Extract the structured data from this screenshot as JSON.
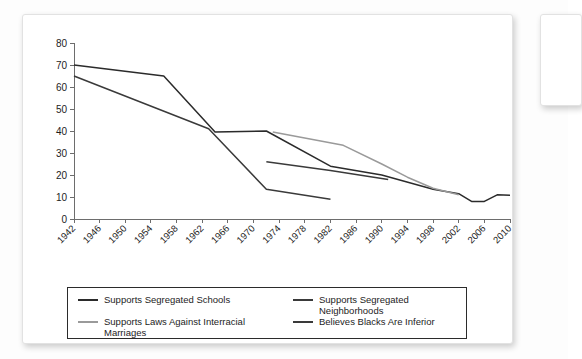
{
  "chart_data": {
    "type": "line",
    "title": "",
    "xlabel": "",
    "ylabel": "",
    "ylim": [
      0,
      80
    ],
    "yticks": [
      0,
      10,
      20,
      30,
      40,
      50,
      60,
      70,
      80
    ],
    "xticks": [
      "1942",
      "1946",
      "1950",
      "1954",
      "1958",
      "1962",
      "1966",
      "1970",
      "1974",
      "1978",
      "1982",
      "1986",
      "1990",
      "1994",
      "1998",
      "2002",
      "2006",
      "2010"
    ],
    "grid": false,
    "legend_position": "bottom",
    "series": [
      {
        "name": "Supports Segregated Schools",
        "color": "#2b2b2b",
        "points": [
          [
            1942,
            70
          ],
          [
            1956,
            65
          ],
          [
            1964,
            39.5
          ],
          [
            1972,
            40
          ],
          [
            1982,
            24
          ],
          [
            1990,
            20
          ],
          [
            1998,
            13.5
          ],
          [
            2002,
            11.5
          ],
          [
            2004,
            8
          ],
          [
            2006,
            8
          ],
          [
            2008,
            11
          ],
          [
            2010,
            10.8
          ]
        ]
      },
      {
        "name": "Supports Laws Against Interracial Marriages",
        "color": "#9a9a9a",
        "points": [
          [
            1973,
            39.5
          ],
          [
            1984,
            33.5
          ],
          [
            1990,
            25
          ],
          [
            1994,
            19
          ],
          [
            1998,
            14
          ],
          [
            2002,
            11
          ]
        ]
      },
      {
        "name": "Supports Segregated Neighborhoods",
        "color": "#3a3a3a",
        "points": [
          [
            1942,
            65
          ],
          [
            1963,
            41
          ],
          [
            1972,
            13.5
          ],
          [
            1982,
            9
          ]
        ]
      },
      {
        "name": "Believes Blacks Are Inferior",
        "color": "#3a3a3a",
        "points": [
          [
            1972,
            26
          ],
          [
            1982,
            22
          ],
          [
            1991,
            18
          ]
        ]
      }
    ]
  },
  "legend": {
    "entries": [
      {
        "label": "Supports Segregated Schools",
        "color": "#2b2b2b"
      },
      {
        "label": "Supports Segregated Neighborhoods",
        "color": "#3a3a3a"
      },
      {
        "label": "Supports Laws Against Interracial Marriages",
        "color": "#9a9a9a"
      },
      {
        "label": "Believes Blacks Are Inferior",
        "color": "#3a3a3a"
      }
    ]
  },
  "colors": {
    "card_background": "#ffffff",
    "card_border": "#e2e2e2",
    "axis": "#6d6d6d",
    "text": "#1d1d1d",
    "legend_border": "#2b2b2b"
  }
}
